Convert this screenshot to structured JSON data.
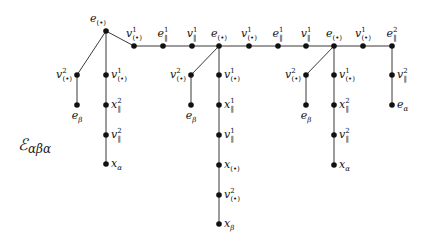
{
  "diagram": {
    "title": "ℰ",
    "title_sub": "αβα",
    "title_pos": [
      18,
      150
    ],
    "nodes": [
      {
        "id": "r",
        "x": 106,
        "y": 31,
        "base": "e",
        "sub": "(•)",
        "sup": "",
        "lx": 98,
        "ly": 22,
        "anchor": "middle"
      },
      {
        "id": "t1",
        "x": 134,
        "y": 46,
        "base": "v",
        "sub": "(•)",
        "sup": "1",
        "lx": 134,
        "ly": 37,
        "anchor": "middle"
      },
      {
        "id": "t2",
        "x": 163,
        "y": 46,
        "base": "e",
        "sub": "‖",
        "sup": "1",
        "lx": 163,
        "ly": 37,
        "anchor": "middle"
      },
      {
        "id": "t3",
        "x": 192,
        "y": 46,
        "base": "v",
        "sub": "‖",
        "sup": "1",
        "lx": 192,
        "ly": 37,
        "anchor": "middle"
      },
      {
        "id": "t4",
        "x": 219,
        "y": 46,
        "base": "e",
        "sub": "(•)",
        "sup": "",
        "lx": 219,
        "ly": 37,
        "anchor": "middle"
      },
      {
        "id": "t5",
        "x": 249,
        "y": 46,
        "base": "v",
        "sub": "(•)",
        "sup": "1",
        "lx": 249,
        "ly": 37,
        "anchor": "middle"
      },
      {
        "id": "t6",
        "x": 278,
        "y": 46,
        "base": "e",
        "sub": "‖",
        "sup": "1",
        "lx": 278,
        "ly": 37,
        "anchor": "middle"
      },
      {
        "id": "t7",
        "x": 306,
        "y": 46,
        "base": "v",
        "sub": "‖",
        "sup": "1",
        "lx": 306,
        "ly": 37,
        "anchor": "middle"
      },
      {
        "id": "t8",
        "x": 334,
        "y": 46,
        "base": "e",
        "sub": "(•)",
        "sup": "",
        "lx": 334,
        "ly": 37,
        "anchor": "middle"
      },
      {
        "id": "t9",
        "x": 363,
        "y": 46,
        "base": "v",
        "sub": "(•)",
        "sup": "1",
        "lx": 363,
        "ly": 37,
        "anchor": "middle"
      },
      {
        "id": "t10",
        "x": 392,
        "y": 46,
        "base": "e",
        "sub": "‖",
        "sup": "2",
        "lx": 392,
        "ly": 37,
        "anchor": "middle"
      },
      {
        "id": "a1",
        "x": 77,
        "y": 75,
        "base": "v",
        "sub": "(•)",
        "sup": "2",
        "lx": 72,
        "ly": 78,
        "anchor": "end"
      },
      {
        "id": "a2",
        "x": 77,
        "y": 105,
        "base": "e",
        "sub": "β",
        "sup": "",
        "lx": 77,
        "ly": 119,
        "anchor": "middle"
      },
      {
        "id": "b1",
        "x": 106,
        "y": 75,
        "base": "v",
        "sub": "(•)",
        "sup": "1",
        "lx": 111,
        "ly": 78,
        "anchor": "start"
      },
      {
        "id": "b2",
        "x": 106,
        "y": 105,
        "base": "x",
        "sub": "‖",
        "sup": "2",
        "lx": 111,
        "ly": 108,
        "anchor": "start"
      },
      {
        "id": "b3",
        "x": 106,
        "y": 135,
        "base": "v",
        "sub": "‖",
        "sup": "2",
        "lx": 111,
        "ly": 138,
        "anchor": "start"
      },
      {
        "id": "b4",
        "x": 106,
        "y": 164,
        "base": "x",
        "sub": "α",
        "sup": "",
        "lx": 111,
        "ly": 167,
        "anchor": "start"
      },
      {
        "id": "c1",
        "x": 191,
        "y": 75,
        "base": "v",
        "sub": "(•)",
        "sup": "2",
        "lx": 186,
        "ly": 78,
        "anchor": "end"
      },
      {
        "id": "c2",
        "x": 191,
        "y": 105,
        "base": "e",
        "sub": "β",
        "sup": "",
        "lx": 191,
        "ly": 119,
        "anchor": "middle"
      },
      {
        "id": "d1",
        "x": 219,
        "y": 75,
        "base": "v",
        "sub": "(•)",
        "sup": "1",
        "lx": 224,
        "ly": 78,
        "anchor": "start"
      },
      {
        "id": "d2",
        "x": 219,
        "y": 105,
        "base": "x",
        "sub": "‖",
        "sup": "1",
        "lx": 224,
        "ly": 108,
        "anchor": "start"
      },
      {
        "id": "d3",
        "x": 219,
        "y": 135,
        "base": "v",
        "sub": "‖",
        "sup": "1",
        "lx": 224,
        "ly": 138,
        "anchor": "start"
      },
      {
        "id": "d4",
        "x": 219,
        "y": 165,
        "base": "x",
        "sub": "(•)",
        "sup": "",
        "lx": 224,
        "ly": 168,
        "anchor": "start"
      },
      {
        "id": "d5",
        "x": 219,
        "y": 195,
        "base": "v",
        "sub": "(•)",
        "sup": "2",
        "lx": 224,
        "ly": 198,
        "anchor": "start"
      },
      {
        "id": "d6",
        "x": 219,
        "y": 224,
        "base": "x",
        "sub": "β",
        "sup": "",
        "lx": 224,
        "ly": 227,
        "anchor": "start"
      },
      {
        "id": "f1",
        "x": 306,
        "y": 75,
        "base": "v",
        "sub": "(•)",
        "sup": "2",
        "lx": 301,
        "ly": 78,
        "anchor": "end"
      },
      {
        "id": "f2",
        "x": 306,
        "y": 105,
        "base": "e",
        "sub": "β",
        "sup": "",
        "lx": 306,
        "ly": 119,
        "anchor": "middle"
      },
      {
        "id": "g1",
        "x": 334,
        "y": 75,
        "base": "v",
        "sub": "(•)",
        "sup": "1",
        "lx": 339,
        "ly": 78,
        "anchor": "start"
      },
      {
        "id": "g2",
        "x": 334,
        "y": 105,
        "base": "x",
        "sub": "‖",
        "sup": "2",
        "lx": 339,
        "ly": 108,
        "anchor": "start"
      },
      {
        "id": "g3",
        "x": 334,
        "y": 135,
        "base": "v",
        "sub": "‖",
        "sup": "2",
        "lx": 339,
        "ly": 138,
        "anchor": "start"
      },
      {
        "id": "g4",
        "x": 334,
        "y": 165,
        "base": "x",
        "sub": "α",
        "sup": "",
        "lx": 339,
        "ly": 168,
        "anchor": "start"
      },
      {
        "id": "h1",
        "x": 392,
        "y": 75,
        "base": "v",
        "sub": "‖",
        "sup": "2",
        "lx": 397,
        "ly": 78,
        "anchor": "start"
      },
      {
        "id": "h2",
        "x": 392,
        "y": 105,
        "base": "e",
        "sub": "α",
        "sup": "",
        "lx": 397,
        "ly": 108,
        "anchor": "start"
      }
    ],
    "edges": [
      [
        "r",
        "t1"
      ],
      [
        "t1",
        "t2"
      ],
      [
        "t2",
        "t3"
      ],
      [
        "t3",
        "t4"
      ],
      [
        "t4",
        "t5"
      ],
      [
        "t5",
        "t6"
      ],
      [
        "t6",
        "t7"
      ],
      [
        "t7",
        "t8"
      ],
      [
        "t8",
        "t9"
      ],
      [
        "t9",
        "t10"
      ],
      [
        "r",
        "a1"
      ],
      [
        "a1",
        "a2"
      ],
      [
        "r",
        "b1"
      ],
      [
        "b1",
        "b2"
      ],
      [
        "b2",
        "b3"
      ],
      [
        "b3",
        "b4"
      ],
      [
        "t4",
        "c1"
      ],
      [
        "c1",
        "c2"
      ],
      [
        "t4",
        "d1"
      ],
      [
        "d1",
        "d2"
      ],
      [
        "d2",
        "d3"
      ],
      [
        "d3",
        "d4"
      ],
      [
        "d4",
        "d5"
      ],
      [
        "d5",
        "d6"
      ],
      [
        "t8",
        "f1"
      ],
      [
        "f1",
        "f2"
      ],
      [
        "t8",
        "g1"
      ],
      [
        "g1",
        "g2"
      ],
      [
        "g2",
        "g3"
      ],
      [
        "g3",
        "g4"
      ],
      [
        "t10",
        "h1"
      ],
      [
        "h1",
        "h2"
      ]
    ]
  }
}
